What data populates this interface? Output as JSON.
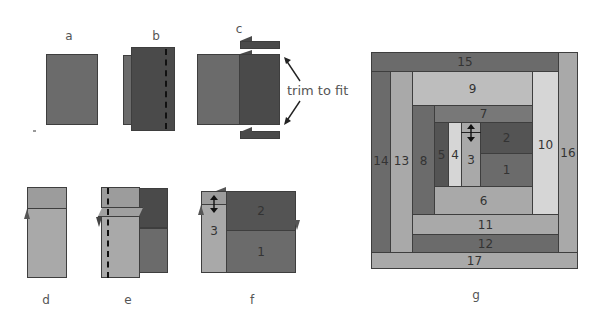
{
  "labels": {
    "a": "a",
    "b": "b",
    "c": "c",
    "d": "d",
    "e": "e",
    "f": "f",
    "g": "g"
  },
  "annotation": {
    "trim": "trim to fit"
  },
  "colors": {
    "mid_dark": "#6b6b6b",
    "dark": "#545454",
    "darker": "#4a4a4a",
    "medium": "#787878",
    "light": "#a9a9a9",
    "lighter": "#bdbdbd",
    "lightest": "#d6d6d6",
    "outline": "#3e3e3e"
  },
  "figure_f": {
    "pieces": [
      "1",
      "2",
      "3"
    ]
  },
  "block_g": {
    "pieces": [
      "1",
      "2",
      "3",
      "4",
      "5",
      "6",
      "7",
      "8",
      "9",
      "10",
      "11",
      "12",
      "13",
      "14",
      "15",
      "16",
      "17"
    ]
  }
}
